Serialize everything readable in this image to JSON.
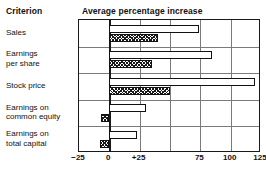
{
  "header": {
    "criterion_label": "Criterion",
    "title": "Average percentage increase"
  },
  "chart_data": {
    "type": "bar",
    "orientation": "horizontal",
    "title": "Average percentage increase",
    "xlabel": "",
    "ylabel": "Criterion",
    "xlim": [
      -25,
      125
    ],
    "grid": true,
    "legend_position": "none",
    "tick_labels": [
      "−25",
      "0",
      "+25",
      "",
      "75",
      "100",
      "125"
    ],
    "tick_values": [
      -25,
      0,
      25,
      50,
      75,
      100,
      125
    ],
    "categories": [
      "Sales",
      "Earnings\nper share",
      "Stock price",
      "Earnings on\ncommon equity",
      "Earnings on\ntotal capital"
    ],
    "series": [
      {
        "name": "open",
        "style": "white-outline",
        "values": [
          74,
          85,
          120,
          30,
          23
        ]
      },
      {
        "name": "hatched",
        "style": "cross-hatched",
        "values": [
          40,
          35,
          50,
          -7,
          -8
        ]
      }
    ]
  },
  "colors": {
    "frame": "#1a1a1a",
    "gridline": "#7a7a7a",
    "bar_outline": "#111111",
    "bar_fill_open": "#ffffff",
    "hatch": "#1a1a1a",
    "background": "#ffffff"
  }
}
